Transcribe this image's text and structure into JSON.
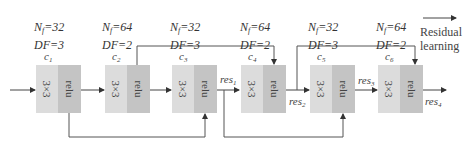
{
  "diagram": {
    "blocks": [
      {
        "id": "c1",
        "name": "c",
        "sub": "1",
        "nf_label": "N",
        "nf_sub": "f",
        "nf_value": "=32",
        "df": "DF=3",
        "conv": "3×3",
        "act": "relu"
      },
      {
        "id": "c2",
        "name": "c",
        "sub": "2",
        "nf_label": "N",
        "nf_sub": "f",
        "nf_value": "=64",
        "df": "DF=2",
        "conv": "3×3",
        "act": "relu"
      },
      {
        "id": "c3",
        "name": "c",
        "sub": "3",
        "nf_label": "N",
        "nf_sub": "f",
        "nf_value": "=32",
        "df": "DF=3",
        "conv": "3×3",
        "act": "relu"
      },
      {
        "id": "c4",
        "name": "c",
        "sub": "4",
        "nf_label": "N",
        "nf_sub": "f",
        "nf_value": "=64",
        "df": "DF=2",
        "conv": "3×3",
        "act": "relu"
      },
      {
        "id": "c5",
        "name": "c",
        "sub": "5",
        "nf_label": "N",
        "nf_sub": "f",
        "nf_value": "=32",
        "df": "DF=3",
        "conv": "3×3",
        "act": "relu"
      },
      {
        "id": "c6",
        "name": "c",
        "sub": "6",
        "nf_label": "N",
        "nf_sub": "f",
        "nf_value": "=64",
        "df": "DF=2",
        "conv": "3×3",
        "act": "relu"
      }
    ],
    "residuals": [
      {
        "name": "res",
        "sub": "1"
      },
      {
        "name": "res",
        "sub": "2"
      },
      {
        "name": "res",
        "sub": "3"
      },
      {
        "name": "res",
        "sub": "4"
      }
    ],
    "legend": {
      "line1": "Residual",
      "line2": "learning"
    },
    "colors": {
      "conv_fill": "#dcdcdc",
      "relu_fill": "#c4c4c4",
      "line": "#555555"
    }
  }
}
